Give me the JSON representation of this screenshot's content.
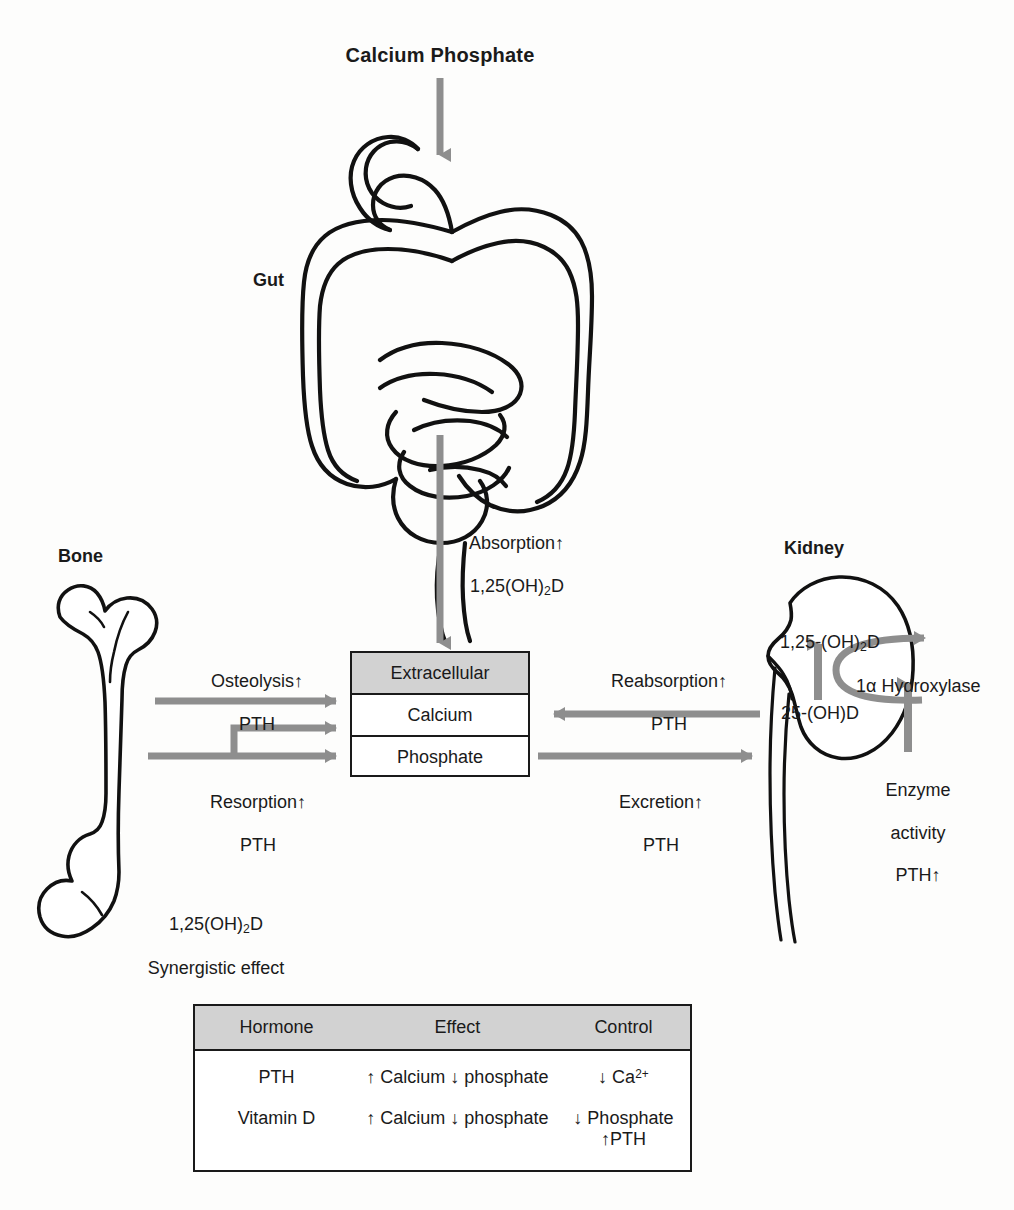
{
  "diagram": {
    "title": "Calcium Phosphate",
    "organs": {
      "gut": "Gut",
      "bone": "Bone",
      "kidney": "Kidney"
    },
    "compartment": {
      "header": "Extracellular",
      "row_calcium": "Calcium",
      "row_phosphate": "Phosphate"
    },
    "flows": {
      "absorption_line1": "Absorption↑",
      "absorption_line2_pre": "1,25(OH)",
      "absorption_line2_sub": "2",
      "absorption_line2_post": "D",
      "osteolysis_line1": "Osteolysis↑",
      "osteolysis_line2": "PTH",
      "resorption_line1": "Resorption↑",
      "resorption_line2": "PTH",
      "reabsorption_line1": "Reabsorption↑",
      "reabsorption_line2": "PTH",
      "excretion_line1": "Excretion↑",
      "excretion_line2": "PTH",
      "bone_synergy_line1_pre": "1,25(OH)",
      "bone_synergy_line1_sub": "2",
      "bone_synergy_line1_post": "D",
      "bone_synergy_line2": "Synergistic effect"
    },
    "kidney_detail": {
      "vitd_active_pre": "1,25-(OH)",
      "vitd_active_sub": "2",
      "vitd_active_post": "D",
      "vitd_precursor": "25-(OH)D",
      "enzyme_name_pre": "1",
      "enzyme_name_greek": "α",
      "enzyme_name_post": " Hydroxylase",
      "enzyme_activity_line1": "Enzyme",
      "enzyme_activity_line2": "activity",
      "enzyme_activity_line3": "PTH↑"
    },
    "table": {
      "headers": [
        "Hormone",
        "Effect",
        "Control"
      ],
      "rows": [
        {
          "hormone": "PTH",
          "effect": "↑ Calcium ↓ phosphate",
          "control_line1_pre": "↓ Ca",
          "control_line1_sup": "2+",
          "control_line2": ""
        },
        {
          "hormone": "Vitamin D",
          "effect": "↑ Calcium ↓ phosphate",
          "control_line1_pre": "↓ Phosphate",
          "control_line1_sup": "",
          "control_line2": "↑PTH"
        }
      ]
    },
    "colors": {
      "arrow_gray": "#8e8e8e",
      "outline_black": "#111111",
      "header_fill": "#d2d2d2",
      "background": "#fdfdfc"
    }
  }
}
